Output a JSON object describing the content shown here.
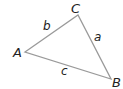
{
  "diagram": {
    "type": "triangle",
    "vertices": [
      {
        "label": "A",
        "x": 25,
        "y": 52
      },
      {
        "label": "B",
        "x": 111,
        "y": 79
      },
      {
        "label": "C",
        "x": 78,
        "y": 15
      }
    ],
    "sides": [
      {
        "label": "a",
        "from": "B",
        "to": "C"
      },
      {
        "label": "b",
        "from": "A",
        "to": "C"
      },
      {
        "label": "c",
        "from": "A",
        "to": "B"
      }
    ],
    "line_color": "#9a9a9a",
    "text_color": "#222222"
  }
}
